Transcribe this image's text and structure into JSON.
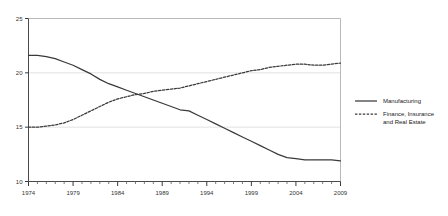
{
  "chart_data": {
    "type": "line",
    "title": "",
    "subtitle": "",
    "xlabel": "",
    "ylabel": "",
    "xlim": [
      1974,
      2009
    ],
    "ylim": [
      10,
      25
    ],
    "ytick_labels": [
      "10",
      "15",
      "20",
      "25"
    ],
    "yticks": [
      10,
      15,
      20,
      25
    ],
    "xtick_labels": [
      "1974",
      "1979",
      "1984",
      "1989",
      "1994",
      "1999",
      "2004",
      "2009"
    ],
    "xticks": [
      1974,
      1979,
      1984,
      1989,
      1994,
      1999,
      2004,
      2009
    ],
    "minor_xtick_interval": 1,
    "grid": "horizontal-only",
    "legend_position": "right",
    "x": [
      1974,
      1975,
      1976,
      1977,
      1978,
      1979,
      1980,
      1981,
      1982,
      1983,
      1984,
      1985,
      1986,
      1987,
      1988,
      1989,
      1990,
      1991,
      1992,
      1993,
      1994,
      1995,
      1996,
      1997,
      1998,
      1999,
      2000,
      2001,
      2002,
      2003,
      2004,
      2005,
      2006,
      2007,
      2008,
      2009
    ],
    "series": [
      {
        "name": "Manufacturing",
        "style": "solid",
        "color": "#3a3a3a",
        "values": [
          21.6,
          21.6,
          21.5,
          21.3,
          21.0,
          20.7,
          20.3,
          19.9,
          19.4,
          19.0,
          18.7,
          18.4,
          18.1,
          17.8,
          17.5,
          17.2,
          16.9,
          16.6,
          16.5,
          16.1,
          15.7,
          15.3,
          14.9,
          14.5,
          14.1,
          13.7,
          13.3,
          12.9,
          12.5,
          12.2,
          12.1,
          12.0,
          12.0,
          12.0,
          12.0,
          11.9
        ]
      },
      {
        "name": "Finance, Insurance and Real Estate",
        "style": "dotted",
        "color": "#3a3a3a",
        "values": [
          15.0,
          15.0,
          15.1,
          15.2,
          15.4,
          15.7,
          16.1,
          16.5,
          16.9,
          17.3,
          17.6,
          17.8,
          18.0,
          18.1,
          18.3,
          18.4,
          18.5,
          18.6,
          18.8,
          19.0,
          19.2,
          19.4,
          19.6,
          19.8,
          20.0,
          20.2,
          20.3,
          20.5,
          20.6,
          20.7,
          20.8,
          20.8,
          20.7,
          20.7,
          20.8,
          20.9
        ]
      }
    ]
  },
  "legend": {
    "items": [
      {
        "label": "Manufacturing",
        "style": "solid"
      },
      {
        "label": "Finance, Insurance",
        "label2": "and Real Estate",
        "style": "dotted"
      }
    ]
  }
}
